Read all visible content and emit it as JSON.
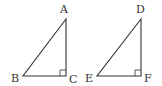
{
  "diagram": {
    "type": "geometry",
    "stroke_color": "#333333",
    "triangles": [
      {
        "name": "ABC",
        "right_angle_at": "C",
        "vertices": [
          {
            "label": "A",
            "x": 66,
            "y": 19
          },
          {
            "label": "B",
            "x": 23,
            "y": 76
          },
          {
            "label": "C",
            "x": 66,
            "y": 76
          }
        ]
      },
      {
        "name": "DEF",
        "right_angle_at": "F",
        "vertices": [
          {
            "label": "D",
            "x": 141,
            "y": 19
          },
          {
            "label": "E",
            "x": 97,
            "y": 76
          },
          {
            "label": "F",
            "x": 141,
            "y": 76
          }
        ]
      }
    ]
  },
  "labels": {
    "A": "A",
    "B": "B",
    "C": "C",
    "D": "D",
    "E": "E",
    "F": "F"
  }
}
